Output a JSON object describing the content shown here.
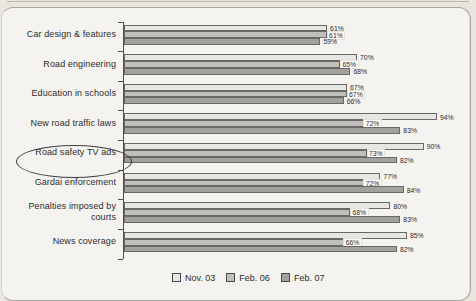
{
  "page": {
    "background_color": "#e9e6e0",
    "panel_color": "#f5f3ef"
  },
  "chart_data": {
    "type": "bar",
    "orientation": "horizontal",
    "title": "",
    "xlabel": "",
    "ylabel": "",
    "xlim": [
      0,
      100
    ],
    "grid": false,
    "legend_position": "bottom",
    "value_suffix": "%",
    "categories": [
      "Car design & features",
      "Road engineering",
      "Education in schools",
      "New road traffic laws",
      "Road safety TV ads",
      "Gardai enforcement",
      "Penalties imposed by courts",
      "News coverage"
    ],
    "series": [
      {
        "name": "Nov. 03",
        "color": "#e8e6e2",
        "values": [
          61,
          70,
          67,
          94,
          90,
          77,
          80,
          85
        ]
      },
      {
        "name": "Feb. 06",
        "color": "#c1bfbc",
        "values": [
          61,
          65,
          67,
          72,
          73,
          72,
          68,
          66
        ]
      },
      {
        "name": "Feb. 07",
        "color": "#a3a19d",
        "values": [
          59,
          68,
          66,
          83,
          82,
          84,
          83,
          82
        ]
      }
    ],
    "annotations": [
      {
        "type": "ellipse",
        "target_category": "Road safety TV ads"
      }
    ]
  }
}
